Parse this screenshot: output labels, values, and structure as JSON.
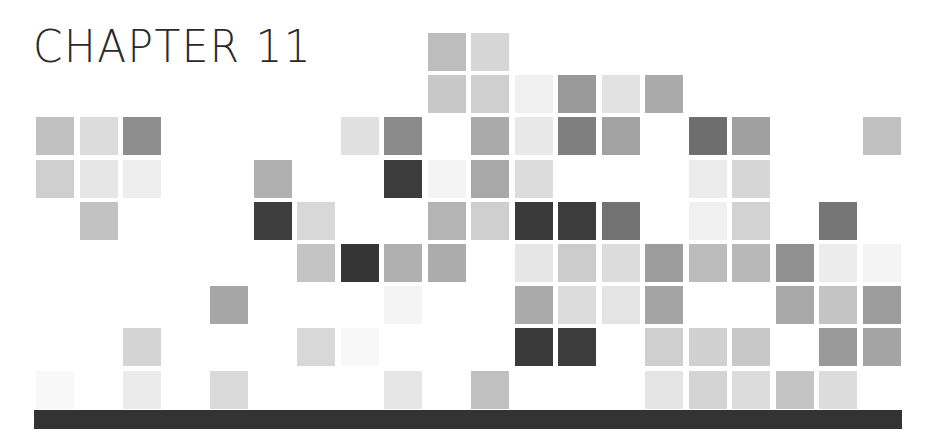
{
  "heading": {
    "title": "CHAPTER 11"
  },
  "grid": {
    "columns": 20,
    "rows": 9,
    "origin_x": 36,
    "origin_y": 33,
    "pitch_x": 43.5,
    "pitch_y": 42.2,
    "cells": [
      {
        "r": 0,
        "c": 9,
        "color": "#bdbdbd"
      },
      {
        "r": 0,
        "c": 10,
        "color": "#d6d6d6"
      },
      {
        "r": 1,
        "c": 9,
        "color": "#c8c8c8"
      },
      {
        "r": 1,
        "c": 10,
        "color": "#cfcfcf"
      },
      {
        "r": 1,
        "c": 11,
        "color": "#f0f0f0"
      },
      {
        "r": 1,
        "c": 12,
        "color": "#999999"
      },
      {
        "r": 1,
        "c": 13,
        "color": "#e2e2e2"
      },
      {
        "r": 1,
        "c": 14,
        "color": "#aaaaaa"
      },
      {
        "r": 2,
        "c": 0,
        "color": "#c0c0c0"
      },
      {
        "r": 2,
        "c": 1,
        "color": "#dcdcdc"
      },
      {
        "r": 2,
        "c": 2,
        "color": "#8e8e8e"
      },
      {
        "r": 2,
        "c": 7,
        "color": "#e0e0e0"
      },
      {
        "r": 2,
        "c": 8,
        "color": "#8a8a8a"
      },
      {
        "r": 2,
        "c": 10,
        "color": "#aaaaaa"
      },
      {
        "r": 2,
        "c": 11,
        "color": "#e8e8e8"
      },
      {
        "r": 2,
        "c": 12,
        "color": "#7f7f7f"
      },
      {
        "r": 2,
        "c": 13,
        "color": "#a2a2a2"
      },
      {
        "r": 2,
        "c": 15,
        "color": "#6e6e6e"
      },
      {
        "r": 2,
        "c": 16,
        "color": "#a0a0a0"
      },
      {
        "r": 2,
        "c": 19,
        "color": "#c0c0c0"
      },
      {
        "r": 3,
        "c": 0,
        "color": "#cfcfcf"
      },
      {
        "r": 3,
        "c": 1,
        "color": "#e6e6e6"
      },
      {
        "r": 3,
        "c": 2,
        "color": "#eeeeee"
      },
      {
        "r": 3,
        "c": 5,
        "color": "#b0b0b0"
      },
      {
        "r": 3,
        "c": 8,
        "color": "#3c3c3c"
      },
      {
        "r": 3,
        "c": 9,
        "color": "#f4f4f4"
      },
      {
        "r": 3,
        "c": 10,
        "color": "#a8a8a8"
      },
      {
        "r": 3,
        "c": 11,
        "color": "#dcdcdc"
      },
      {
        "r": 3,
        "c": 15,
        "color": "#ececec"
      },
      {
        "r": 3,
        "c": 16,
        "color": "#d6d6d6"
      },
      {
        "r": 4,
        "c": 1,
        "color": "#c2c2c2"
      },
      {
        "r": 4,
        "c": 5,
        "color": "#3e3e3e"
      },
      {
        "r": 4,
        "c": 6,
        "color": "#d8d8d8"
      },
      {
        "r": 4,
        "c": 9,
        "color": "#b4b4b4"
      },
      {
        "r": 4,
        "c": 10,
        "color": "#cfcfcf"
      },
      {
        "r": 4,
        "c": 11,
        "color": "#3a3a3a"
      },
      {
        "r": 4,
        "c": 12,
        "color": "#3c3c3c"
      },
      {
        "r": 4,
        "c": 13,
        "color": "#727272"
      },
      {
        "r": 4,
        "c": 15,
        "color": "#f0f0f0"
      },
      {
        "r": 4,
        "c": 16,
        "color": "#d2d2d2"
      },
      {
        "r": 4,
        "c": 18,
        "color": "#767676"
      },
      {
        "r": 5,
        "c": 6,
        "color": "#c4c4c4"
      },
      {
        "r": 5,
        "c": 7,
        "color": "#353535"
      },
      {
        "r": 5,
        "c": 8,
        "color": "#b0b0b0"
      },
      {
        "r": 5,
        "c": 9,
        "color": "#acacac"
      },
      {
        "r": 5,
        "c": 11,
        "color": "#e6e6e6"
      },
      {
        "r": 5,
        "c": 12,
        "color": "#cccccc"
      },
      {
        "r": 5,
        "c": 13,
        "color": "#dcdcdc"
      },
      {
        "r": 5,
        "c": 14,
        "color": "#9c9c9c"
      },
      {
        "r": 5,
        "c": 15,
        "color": "#bcbcbc"
      },
      {
        "r": 5,
        "c": 16,
        "color": "#b8b8b8"
      },
      {
        "r": 5,
        "c": 17,
        "color": "#909090"
      },
      {
        "r": 5,
        "c": 18,
        "color": "#ececec"
      },
      {
        "r": 5,
        "c": 19,
        "color": "#f4f4f4"
      },
      {
        "r": 6,
        "c": 4,
        "color": "#a6a6a6"
      },
      {
        "r": 6,
        "c": 8,
        "color": "#f4f4f4"
      },
      {
        "r": 6,
        "c": 11,
        "color": "#aaaaaa"
      },
      {
        "r": 6,
        "c": 12,
        "color": "#dcdcdc"
      },
      {
        "r": 6,
        "c": 13,
        "color": "#e4e4e4"
      },
      {
        "r": 6,
        "c": 14,
        "color": "#a4a4a4"
      },
      {
        "r": 6,
        "c": 17,
        "color": "#a8a8a8"
      },
      {
        "r": 6,
        "c": 18,
        "color": "#c4c4c4"
      },
      {
        "r": 6,
        "c": 19,
        "color": "#9c9c9c"
      },
      {
        "r": 7,
        "c": 2,
        "color": "#d4d4d4"
      },
      {
        "r": 7,
        "c": 6,
        "color": "#d8d8d8"
      },
      {
        "r": 7,
        "c": 7,
        "color": "#f8f8f8"
      },
      {
        "r": 7,
        "c": 11,
        "color": "#3a3a3a"
      },
      {
        "r": 7,
        "c": 12,
        "color": "#3c3c3c"
      },
      {
        "r": 7,
        "c": 14,
        "color": "#cfcfcf"
      },
      {
        "r": 7,
        "c": 15,
        "color": "#d0d0d0"
      },
      {
        "r": 7,
        "c": 16,
        "color": "#c8c8c8"
      },
      {
        "r": 7,
        "c": 18,
        "color": "#9a9a9a"
      },
      {
        "r": 7,
        "c": 19,
        "color": "#a4a4a4"
      },
      {
        "r": 8,
        "c": 0,
        "color": "#f8f8f8"
      },
      {
        "r": 8,
        "c": 2,
        "color": "#ebebeb"
      },
      {
        "r": 8,
        "c": 4,
        "color": "#dadada"
      },
      {
        "r": 8,
        "c": 8,
        "color": "#e6e6e6"
      },
      {
        "r": 8,
        "c": 10,
        "color": "#c0c0c0"
      },
      {
        "r": 8,
        "c": 14,
        "color": "#e4e4e4"
      },
      {
        "r": 8,
        "c": 15,
        "color": "#d4d4d4"
      },
      {
        "r": 8,
        "c": 16,
        "color": "#dcdcdc"
      },
      {
        "r": 8,
        "c": 17,
        "color": "#c4c4c4"
      },
      {
        "r": 8,
        "c": 18,
        "color": "#dcdcdc"
      }
    ]
  },
  "footer_bar": {
    "color": "#333333"
  }
}
